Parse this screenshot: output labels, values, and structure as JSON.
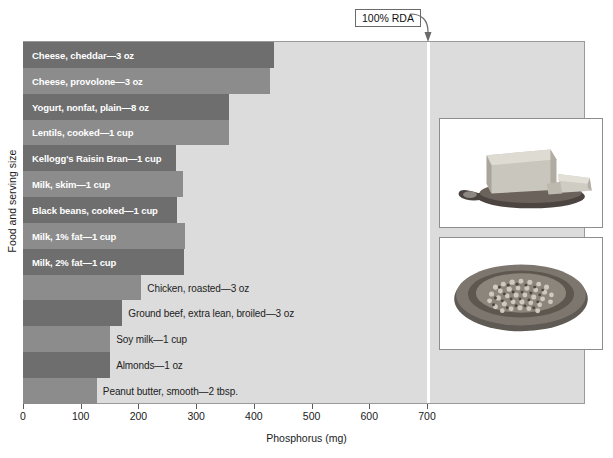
{
  "chart_data": {
    "type": "bar",
    "orientation": "horizontal",
    "title": "",
    "xlabel": "Phosphorus (mg)",
    "ylabel": "Food and serving size",
    "xlim": [
      0,
      975
    ],
    "xticks": [
      0,
      100,
      200,
      300,
      400,
      500,
      600,
      700
    ],
    "xtick_labels": [
      "0",
      "100",
      "200",
      "300",
      "400",
      "500",
      "600",
      "700"
    ],
    "grid": false,
    "legend": "none",
    "reference_line": {
      "label": "100% RDA",
      "value": 700,
      "color": "#ffffff"
    },
    "categories": [
      "Cheese, cheddar—3 oz",
      "Cheese, provolone—3 oz",
      "Yogurt, nonfat, plain—8 oz",
      "Lentils, cooked—1 cup",
      "Kellogg's Raisin Bran—1 cup",
      "Milk, skim—1 cup",
      "Black beans, cooked—1 cup",
      "Milk, 1% fat—1 cup",
      "Milk, 2% fat—1 cup",
      "Chicken, roasted—3 oz",
      "Ground beef, extra lean, broiled—3 oz",
      "Soy milk—1 cup",
      "Almonds—1 oz",
      "Peanut butter, smooth—2 tbsp."
    ],
    "values": [
      435,
      428,
      357,
      357,
      265,
      277,
      267,
      281,
      279,
      205,
      172,
      151,
      151,
      128
    ],
    "label_placement": [
      "inside",
      "inside",
      "inside",
      "inside",
      "inside",
      "inside",
      "inside",
      "inside",
      "inside",
      "outside",
      "outside",
      "outside",
      "outside",
      "outside"
    ],
    "bar_colors": [
      "#6e6e6e",
      "#8c8c8c",
      "#6e6e6e",
      "#8c8c8c",
      "#6e6e6e",
      "#8c8c8c",
      "#6e6e6e",
      "#8c8c8c",
      "#6e6e6e",
      "#8c8c8c",
      "#6e6e6e",
      "#8c8c8c",
      "#6e6e6e",
      "#8c8c8c"
    ],
    "plot_background": "#dcdcdc"
  },
  "photos": [
    {
      "name": "cheese-photo",
      "caption": "Block of cheese on a wooden board"
    },
    {
      "name": "lentils-photo",
      "caption": "Bowl of lentils"
    }
  ]
}
